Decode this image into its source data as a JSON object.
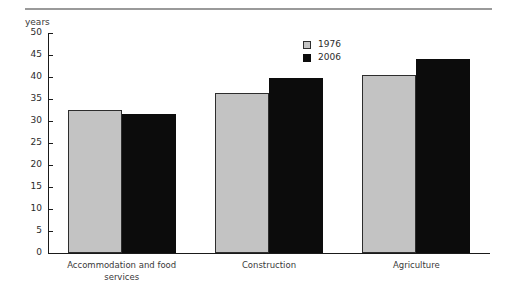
{
  "chart_data": {
    "type": "bar",
    "title": "",
    "subtitle": "",
    "xlabel": "",
    "ylabel": "years",
    "ylim": [
      0,
      50
    ],
    "ytick_step": 5,
    "yticks": [
      "50",
      "45",
      "40",
      "35",
      "30",
      "25",
      "20",
      "15",
      "10",
      "5",
      "0"
    ],
    "grid": false,
    "legend_position": "top-right",
    "categories": [
      "Accommodation and food\nservices",
      "Construction",
      "Agriculture"
    ],
    "series": [
      {
        "name": "1976",
        "color": "#c3c3c3",
        "values": [
          32.5,
          36.3,
          40.4
        ]
      },
      {
        "name": "2006",
        "color": "#0c0c0c",
        "values": [
          31.7,
          39.7,
          44.0
        ]
      }
    ]
  },
  "legend": {
    "entries": [
      {
        "label": "1976"
      },
      {
        "label": "2006"
      }
    ]
  },
  "axis": {
    "units_caption": "years"
  }
}
